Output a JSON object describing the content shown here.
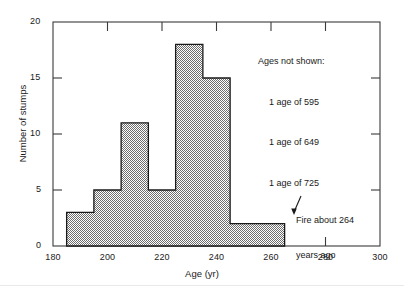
{
  "chart_data": {
    "type": "bar",
    "title": "",
    "subtitle": "",
    "xlabel": "Age (yr)",
    "ylabel": "Number of stumps",
    "xlim": [
      180,
      300
    ],
    "ylim": [
      0,
      20
    ],
    "xticks": [
      180,
      200,
      220,
      240,
      260,
      280,
      300
    ],
    "yticks": [
      0,
      5,
      10,
      15,
      20
    ],
    "xtick_labels": [
      "180",
      "200",
      "220",
      "240",
      "260",
      "280",
      "300"
    ],
    "ytick_labels": [
      "0",
      "5",
      "10",
      "15",
      "20"
    ],
    "grid": false,
    "legend": "none",
    "bin_width": 10,
    "bars": [
      {
        "x0": 185,
        "x1": 195,
        "value": 3
      },
      {
        "x0": 195,
        "x1": 205,
        "value": 5
      },
      {
        "x0": 205,
        "x1": 215,
        "value": 11
      },
      {
        "x0": 215,
        "x1": 225,
        "value": 5
      },
      {
        "x0": 225,
        "x1": 235,
        "value": 18
      },
      {
        "x0": 235,
        "x1": 245,
        "value": 15
      },
      {
        "x0": 245,
        "x1": 255,
        "value": 2
      },
      {
        "x0": 255,
        "x1": 265,
        "value": 2
      }
    ],
    "categories": [
      "185-195",
      "195-205",
      "205-215",
      "215-225",
      "225-235",
      "235-245",
      "245-255",
      "255-265"
    ],
    "values": [
      3,
      5,
      11,
      5,
      18,
      15,
      2,
      2
    ],
    "bar_fill_color": "#a8a8a8",
    "bar_edge_color": "#1a1a1a",
    "annotations": {
      "not_shown": {
        "heading": "Ages not shown:",
        "lines": [
          "1 age of 595",
          "1 age of 649",
          "1 age of 725"
        ]
      },
      "fire": {
        "line1": "Fire about 264",
        "line2": "years ago",
        "arrow": "arrow-down-left",
        "points_to_x": 264,
        "points_to_y": 2
      }
    }
  },
  "axes": {
    "x_axis_label": "Age (yr)",
    "y_axis_label": "Number of stumps"
  }
}
